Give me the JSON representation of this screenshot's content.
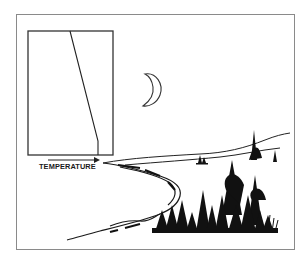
{
  "figure": {
    "axis_label": "TEMPERATURE",
    "axis_arrow": "right-arrow",
    "profile": {
      "description": "temperature profile line in inset box",
      "points": [
        [
          70,
          31
        ],
        [
          98,
          141
        ],
        [
          98,
          155
        ]
      ]
    },
    "scene_elements": [
      "crescent-moon",
      "shoreline",
      "lake",
      "conifer-trees",
      "distant-hills",
      "island"
    ],
    "colors": {
      "ink": "#1a1a1a",
      "frame": "#8a8a8a",
      "background": "#ffffff"
    }
  }
}
